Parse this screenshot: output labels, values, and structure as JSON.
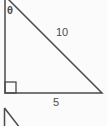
{
  "diagram": {
    "angle_label": "θ",
    "hypotenuse_label": "10",
    "base_label": "5",
    "line_color": "#4b4b4b",
    "label_color": "#4b4b4b",
    "background_color": "#fbfbfb"
  }
}
